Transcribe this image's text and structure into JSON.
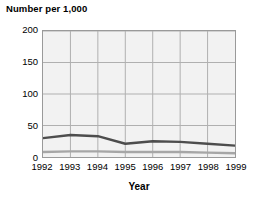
{
  "chart_data": {
    "type": "line",
    "title": "Number per 1,000",
    "xlabel": "Year",
    "ylabel": "",
    "categories": [
      "1992",
      "1993",
      "1994",
      "1995",
      "1996",
      "1997",
      "1998",
      "1999"
    ],
    "x": [
      1992,
      1993,
      1994,
      1995,
      1996,
      1997,
      1998,
      1999
    ],
    "xlim": [
      1992,
      1999
    ],
    "ylim": [
      0,
      200
    ],
    "yticks": [
      0,
      50,
      100,
      150,
      200
    ],
    "ytick_labels": [
      "0",
      "50",
      "100",
      "150",
      "200"
    ],
    "grid": true,
    "legend": "none",
    "series": [
      {
        "name": "upper-series",
        "color": "#4d4d4d",
        "values": [
          30,
          35,
          33,
          21,
          25,
          24,
          21,
          18
        ]
      },
      {
        "name": "lower-series",
        "color": "#a6a6a6",
        "values": [
          8,
          9,
          9,
          8,
          8,
          8,
          7,
          6
        ]
      }
    ]
  },
  "style": {
    "plot_background": "#f2f2f2",
    "grid_color": "#b0b0b0",
    "axis_color": "#9a9a9a",
    "text_color": "#000000"
  }
}
